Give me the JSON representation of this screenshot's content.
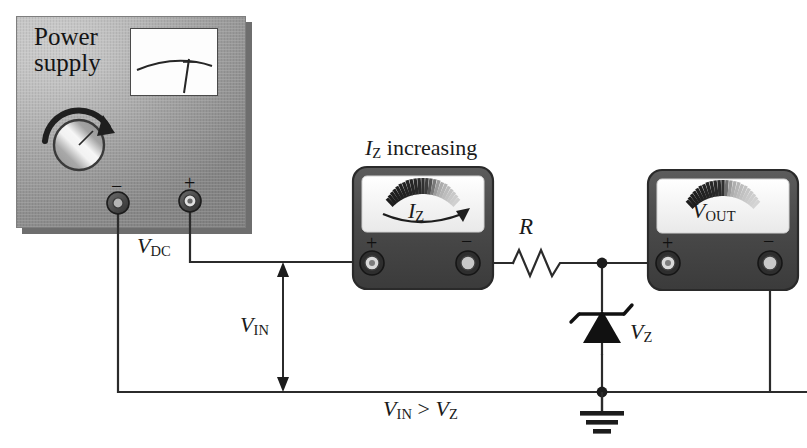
{
  "figure": {
    "type": "circuit-diagram",
    "background_color": "#ffffff",
    "wire_color": "#2b2b2b"
  },
  "power_supply": {
    "title_line1": "Power",
    "title_line2": "supply",
    "panel_color": "#a5a5a5",
    "knob": {
      "name": "voltage-adjust-knob",
      "arrow_direction": "clockwise"
    },
    "display": {
      "name": "panel-meter-display",
      "needle": true
    },
    "terminals": [
      {
        "name": "negative-terminal",
        "label": "−",
        "polarity": "negative"
      },
      {
        "name": "positive-terminal",
        "label": "+",
        "polarity": "positive"
      }
    ],
    "output_label": "V",
    "output_label_sub": "DC"
  },
  "ammeter": {
    "name": "zener-current-ammeter",
    "caption_italic": "I",
    "caption_sub": "Z",
    "caption_rest": " increasing",
    "face_label_italic": "I",
    "face_label_sub": "Z",
    "face_arrow": "increasing-right",
    "body_color": "#4a4a4a",
    "terminals": [
      {
        "name": "ammeter-positive-terminal",
        "label": "+"
      },
      {
        "name": "ammeter-negative-terminal",
        "label": "−"
      }
    ]
  },
  "voltmeter": {
    "name": "output-voltmeter",
    "face_label_italic": "V",
    "face_label_sub": "OUT",
    "body_color": "#4a4a4a",
    "terminals": [
      {
        "name": "voltmeter-positive-terminal",
        "label": "+"
      },
      {
        "name": "voltmeter-negative-terminal",
        "label": "−"
      }
    ]
  },
  "components": {
    "resistor": {
      "name": "series-resistor",
      "label": "R"
    },
    "zener": {
      "name": "zener-diode",
      "label_italic": "V",
      "label_sub": "Z",
      "orientation": "cathode-up"
    },
    "ground": {
      "name": "ground-symbol",
      "bars": 3
    }
  },
  "annotations": {
    "vin_italic": "V",
    "vin_sub": "IN",
    "condition_lhs_italic": "V",
    "condition_lhs_sub": "IN",
    "condition_operator": " > ",
    "condition_rhs_italic": "V",
    "condition_rhs_sub": "Z"
  }
}
